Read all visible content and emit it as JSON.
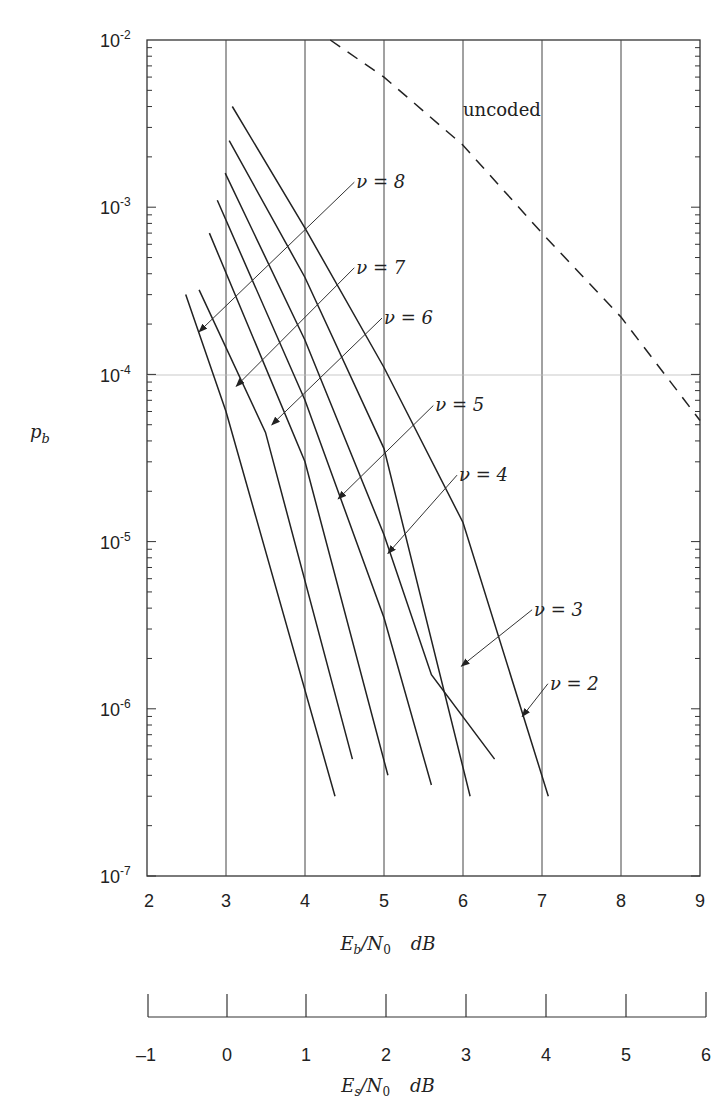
{
  "chart_data": {
    "type": "line",
    "title": "",
    "xlabel": "Eb/N0  dB",
    "ylabel": "p_b",
    "xlim": [
      2,
      9
    ],
    "ylim": [
      1e-07,
      0.01
    ],
    "yscale": "log",
    "grid": "vertical lines at integer Eb/N0, horizontal line at 1e-4",
    "x_ticks": [
      "2",
      "3",
      "4",
      "5",
      "6",
      "7",
      "8",
      "9"
    ],
    "y_ticks": [
      "10^-2",
      "10^-3",
      "10^-4",
      "10^-5",
      "10^-6",
      "10^-7"
    ],
    "secondary_axis": {
      "label": "Es/N0  dB",
      "ticks": [
        "-1",
        "0",
        "1",
        "2",
        "3",
        "4",
        "5",
        "6"
      ]
    },
    "series": [
      {
        "name": "ν = 2",
        "style": "solid",
        "points": [
          [
            3.08,
            0.004
          ],
          [
            4.0,
            0.00075
          ],
          [
            5.0,
            0.00011
          ],
          [
            6.0,
            1.3e-05
          ],
          [
            7.08,
            3e-07
          ]
        ]
      },
      {
        "name": "ν = 3",
        "style": "solid",
        "points": [
          [
            3.04,
            0.0025
          ],
          [
            4.0,
            0.00038
          ],
          [
            5.0,
            3.6e-05
          ],
          [
            6.09,
            3e-07
          ]
        ]
      },
      {
        "name": "ν = 4",
        "style": "solid",
        "points": [
          [
            2.99,
            0.0016
          ],
          [
            4.0,
            0.00016
          ],
          [
            5.0,
            1.1e-05
          ],
          [
            5.6,
            1.6e-06
          ],
          [
            6.4,
            5e-07
          ]
        ]
      },
      {
        "name": "ν = 5",
        "style": "solid",
        "points": [
          [
            2.89,
            0.0011
          ],
          [
            4.0,
            7e-05
          ],
          [
            5.0,
            3.5e-06
          ],
          [
            5.6,
            3.5e-07
          ]
        ]
      },
      {
        "name": "ν = 6",
        "style": "solid",
        "points": [
          [
            2.79,
            0.0007
          ],
          [
            4.0,
            3e-05
          ],
          [
            5.05,
            4e-07
          ]
        ]
      },
      {
        "name": "ν = 7",
        "style": "solid",
        "points": [
          [
            2.66,
            0.00032
          ],
          [
            3.5,
            4.5e-05
          ],
          [
            4.6,
            5e-07
          ]
        ]
      },
      {
        "name": "ν = 8",
        "style": "solid",
        "points": [
          [
            2.49,
            0.0003
          ],
          [
            3.0,
            6e-05
          ],
          [
            4.38,
            3e-07
          ]
        ]
      },
      {
        "name": "uncoded",
        "style": "dashed",
        "points": [
          [
            4.32,
            0.01
          ],
          [
            5.0,
            0.006
          ],
          [
            6.0,
            0.00235
          ],
          [
            7.0,
            0.0007
          ],
          [
            8.0,
            0.00022
          ],
          [
            9.0,
            5.3e-05
          ]
        ]
      }
    ],
    "annotations": [
      {
        "text": "uncoded",
        "x": 6.0,
        "y": 0.0035
      },
      {
        "text": "ν = 8",
        "x": 4.65,
        "y": 0.0013,
        "arrow_to": [
          2.66,
          0.00018
        ]
      },
      {
        "text": "ν = 7",
        "x": 4.65,
        "y": 0.0004,
        "arrow_to": [
          3.13,
          8.5e-05
        ]
      },
      {
        "text": "ν = 6",
        "x": 5.0,
        "y": 0.0002,
        "arrow_to": [
          3.58,
          5e-05
        ]
      },
      {
        "text": "ν = 5",
        "x": 5.65,
        "y": 6e-05,
        "arrow_to": [
          4.42,
          1.8e-05
        ]
      },
      {
        "text": "ν = 4",
        "x": 5.95,
        "y": 2.3e-05,
        "arrow_to": [
          5.05,
          8.5e-06
        ]
      },
      {
        "text": "ν = 3",
        "x": 6.9,
        "y": 3.6e-06,
        "arrow_to": [
          5.98,
          1.8e-06
        ]
      },
      {
        "text": "ν = 2",
        "x": 7.1,
        "y": 1.3e-06,
        "arrow_to": [
          6.75,
          9e-07
        ]
      }
    ]
  },
  "labels": {
    "y_axis": "p",
    "y_axis_sub": "b",
    "x_axis_primary": "E",
    "x_axis_primary_sub": "b",
    "x_axis_primary_rest": "/N",
    "x_axis_primary_sub2": "0",
    "x_axis_unit": "dB",
    "x_axis_secondary": "E",
    "x_axis_secondary_sub": "s",
    "x_axis_secondary_rest": "/N",
    "x_axis_secondary_sub2": "0",
    "uncoded": "uncoded",
    "nu_labels": [
      "ν = 8",
      "ν = 7",
      "ν = 6",
      "ν = 5",
      "ν = 4",
      "ν = 3",
      "ν = 2"
    ],
    "x_ticks": [
      "2",
      "3",
      "4",
      "5",
      "6",
      "7",
      "8",
      "9"
    ],
    "es_ticks": [
      "–1",
      "0",
      "1",
      "2",
      "3",
      "4",
      "5",
      "6"
    ],
    "y_tick_base": "10",
    "y_tick_exps": [
      "-2",
      "-3",
      "-4",
      "-5",
      "-6",
      "-7"
    ]
  }
}
